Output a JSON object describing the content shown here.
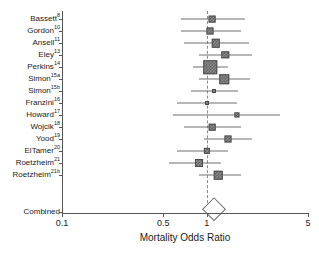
{
  "chart_data": {
    "type": "scatter",
    "subtype": "forest-plot",
    "title": "",
    "xlabel": "Mortality Odds Ratio",
    "ylabel": "",
    "xscale": "log",
    "xlim": [
      0.1,
      5
    ],
    "xticks": [
      0.1,
      0.5,
      1,
      5
    ],
    "xticklabels": [
      "0.1",
      "0.5",
      "1",
      "5"
    ],
    "grid": false,
    "legend": false,
    "reference_line": 1.0,
    "studies": [
      {
        "label": "Bassett",
        "ref": "8",
        "or": 1.09,
        "ci_low": 0.66,
        "ci_high": 1.85,
        "weight": 0.28
      },
      {
        "label": "Gordon",
        "ref": "10",
        "or": 1.05,
        "ci_low": 0.66,
        "ci_high": 1.72,
        "weight": 0.3
      },
      {
        "label": "Ansell",
        "ref": "11",
        "or": 1.15,
        "ci_low": 0.7,
        "ci_high": 1.95,
        "weight": 0.45
      },
      {
        "label": "Eley",
        "ref": "13",
        "or": 1.34,
        "ci_low": 0.88,
        "ci_high": 2.05,
        "weight": 0.34
      },
      {
        "label": "Perkins",
        "ref": "14",
        "or": 1.06,
        "ci_low": 0.8,
        "ci_high": 1.4,
        "weight": 0.95
      },
      {
        "label": "Simon",
        "ref": "15a",
        "or": 1.32,
        "ci_low": 0.88,
        "ci_high": 2.0,
        "weight": 0.55
      },
      {
        "label": "Simon",
        "ref": "15b",
        "or": 1.12,
        "ci_low": 0.78,
        "ci_high": 1.65,
        "weight": 0.0
      },
      {
        "label": "Franzini",
        "ref": "16",
        "or": 1.0,
        "ci_low": 0.62,
        "ci_high": 1.62,
        "weight": 0.0
      },
      {
        "label": "Howard",
        "ref": "17",
        "or": 1.62,
        "ci_low": 0.58,
        "ci_high": 3.2,
        "weight": 0.12
      },
      {
        "label": "Wojcik",
        "ref": "18",
        "or": 1.09,
        "ci_low": 0.7,
        "ci_high": 1.72,
        "weight": 0.26
      },
      {
        "label": "Yood",
        "ref": "19",
        "or": 1.4,
        "ci_low": 0.95,
        "ci_high": 2.05,
        "weight": 0.3
      },
      {
        "label": "ElTamer",
        "ref": "20",
        "or": 1.0,
        "ci_low": 0.62,
        "ci_high": 1.4,
        "weight": 0.22
      },
      {
        "label": "Roetzheim",
        "ref": "21",
        "or": 0.88,
        "ci_low": 0.55,
        "ci_high": 1.25,
        "weight": 0.4
      },
      {
        "label": "Roetzheim",
        "ref": "21b",
        "or": 1.2,
        "ci_low": 0.88,
        "ci_high": 1.72,
        "weight": 0.45
      }
    ],
    "combined": {
      "label": "Combined",
      "or": 1.12,
      "ci_low": 0.98,
      "ci_high": 1.28
    }
  },
  "colors": {
    "marker_fill": "#8c8c8c",
    "marker_edge": "#4a4a4a",
    "ci_line": "#6e6e6e",
    "axis": "#555555",
    "reference_line": "#8a8a8a",
    "text": "#1a1a1a",
    "background": "#ffffff"
  }
}
